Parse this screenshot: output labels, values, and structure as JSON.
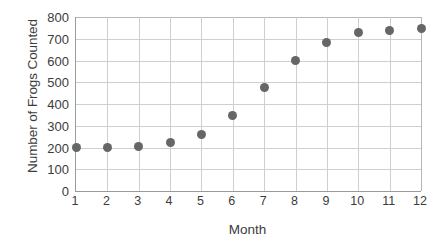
{
  "chart_data": {
    "type": "scatter",
    "title": "",
    "xlabel": "Month",
    "ylabel": "Number of Frogs Counted",
    "x": [
      1,
      2,
      3,
      4,
      5,
      6,
      7,
      8,
      9,
      10,
      11,
      12
    ],
    "values": [
      200,
      202,
      205,
      222,
      262,
      348,
      474,
      600,
      681,
      727,
      740,
      745
    ],
    "series": [
      {
        "name": "Frogs Counted",
        "values": [
          200,
          202,
          205,
          222,
          262,
          348,
          474,
          600,
          681,
          727,
          740,
          745
        ]
      }
    ],
    "xlim": [
      1,
      12
    ],
    "ylim": [
      0,
      800
    ],
    "ytick_labels": [
      "0",
      "100",
      "200",
      "300",
      "400",
      "500",
      "600",
      "700",
      "800"
    ],
    "ytick_values": [
      0,
      100,
      200,
      300,
      400,
      500,
      600,
      700,
      800
    ],
    "xtick_labels": [
      "1",
      "2",
      "3",
      "4",
      "5",
      "6",
      "7",
      "8",
      "9",
      "10",
      "11",
      "12"
    ],
    "xtick_values": [
      1,
      2,
      3,
      4,
      5,
      6,
      7,
      8,
      9,
      10,
      11,
      12
    ],
    "grid": true,
    "legend": false,
    "marker_color": "#666666",
    "grid_color": "#cfcfcf",
    "axis_color": "#9a9a9a",
    "text_color": "#3c3c3c",
    "background": "#ffffff"
  }
}
